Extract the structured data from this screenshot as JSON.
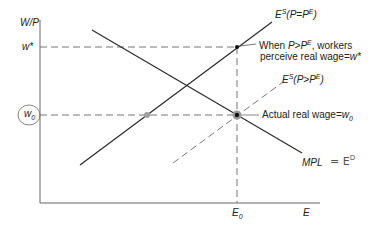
{
  "axes": {
    "y_label": "W/P",
    "x_label": "E",
    "y_ticks": {
      "w_star": "w*",
      "w0": "w",
      "w0_sub": "0"
    },
    "x_ticks": {
      "E0": "E",
      "E0_sub": "0"
    }
  },
  "curves": {
    "es_equal": {
      "prefix": "E",
      "sup": "S",
      "cond": "(P=P",
      "cond_sup": "E",
      "cond_end": ")"
    },
    "es_greater": {
      "prefix": "E",
      "sup": "S",
      "cond": "(P>P",
      "cond_sup": "E",
      "cond_end": ")"
    },
    "mpl": {
      "label": "MPL"
    }
  },
  "annotations": {
    "perceive_line1_a": "When ",
    "perceive_line1_b": "P>P",
    "perceive_line1_sup": "E",
    "perceive_line1_c": ", workers",
    "perceive_line2_a": "perceive real wage=",
    "perceive_line2_b": "w*",
    "actual_a": "Actual real wage=",
    "actual_b": "w",
    "actual_sub": "0",
    "handwritten_note": "= E",
    "handwritten_sup": "D"
  },
  "colors": {
    "line": "#2a2a2a",
    "axis": "#555555",
    "dash": "#666666",
    "point": "#111111",
    "halo": "#9a9a9a",
    "hand": "#666666"
  }
}
